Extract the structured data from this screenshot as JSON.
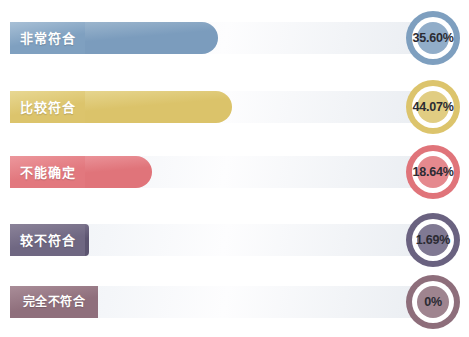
{
  "chart_data": {
    "type": "bar",
    "title": "",
    "xlabel": "",
    "ylabel": "",
    "orientation": "horizontal",
    "grid": false,
    "legend": "none",
    "xlim": [
      0,
      100
    ],
    "categories": [
      "非常符合",
      "比较符合",
      "不能确定",
      "较不符合",
      "完全不符合"
    ],
    "values": [
      35.6,
      44.07,
      18.64,
      1.69,
      0
    ],
    "value_labels": [
      "35.60%",
      "44.07%",
      "18.64%",
      "1.69%",
      "0%"
    ],
    "series": [
      {
        "name": "占比",
        "values": [
          35.6,
          44.07,
          18.64,
          1.69,
          0
        ]
      }
    ]
  },
  "rows": [
    {
      "label": "非常符合",
      "value_label": "35.60%",
      "value": 35.6,
      "bar_end_px": 218,
      "plate_width_px": 75,
      "color": "#7b9cbd",
      "color_light": "#9bb5cd",
      "plate_color": "#7fa0c0",
      "plate_color_light": "#a8c0d6",
      "ring_color": "#7e9fbf"
    },
    {
      "label": "比较符合",
      "value_label": "44.07%",
      "value": 44.07,
      "bar_end_px": 232,
      "plate_width_px": 75,
      "color": "#dbc36a",
      "color_light": "#e6d58e",
      "plate_color": "#dcc46c",
      "plate_color_light": "#e8d893",
      "ring_color": "#dcc46c"
    },
    {
      "label": "不能确定",
      "value_label": "18.64%",
      "value": 18.64,
      "bar_end_px": 152,
      "plate_width_px": 75,
      "color": "#e0747a",
      "color_light": "#ea9298",
      "plate_color": "#e2787e",
      "plate_color_light": "#ec979c",
      "ring_color": "#e0747a"
    },
    {
      "label": "较不符合",
      "value_label": "1.69%",
      "value": 1.69,
      "bar_end_px": 89,
      "plate_width_px": 75,
      "color": "#5c5470",
      "color_light": "#756d88",
      "plate_color": "#6f6782",
      "plate_color_light": "#8b8399",
      "ring_color": "#6a6280"
    },
    {
      "label": "完全不符合",
      "value_label": "0%",
      "value": 0,
      "bar_end_px": 85,
      "plate_width_px": 88,
      "color": "#8a6b78",
      "color_light": "#a2858f",
      "plate_color": "#8f6f7c",
      "plate_color_light": "#a98d98",
      "ring_color": "#8e6e7b"
    }
  ],
  "layout": {
    "row_tops": [
      10,
      79,
      144,
      212,
      274
    ]
  }
}
